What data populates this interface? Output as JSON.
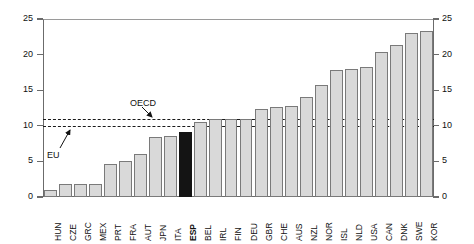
{
  "chart_data": {
    "type": "bar",
    "title": "",
    "subtitle": "",
    "xlabel": "",
    "ylabel": "",
    "ylim": [
      0,
      25
    ],
    "yticks": [
      0,
      5,
      10,
      15,
      20,
      25
    ],
    "ytick_labels": [
      "0",
      "5",
      "10",
      "15",
      "20",
      "25"
    ],
    "grid": false,
    "legend": "none",
    "dual_axis": true,
    "right_axis_ticks": [
      "0",
      "5",
      "10",
      "15",
      "20",
      "25"
    ],
    "categories": [
      "HUN",
      "CZE",
      "GRC",
      "MEX",
      "PRT",
      "FRA",
      "AUT",
      "JPN",
      "ITA",
      "ESP",
      "BEL",
      "IRL",
      "FIN",
      "DEU",
      "GBR",
      "CHE",
      "AUS",
      "NZL",
      "NOR",
      "ISL",
      "NLD",
      "USA",
      "CAN",
      "DNK",
      "SWE",
      "KOR"
    ],
    "values": [
      1.0,
      1.85,
      1.85,
      1.85,
      4.7,
      5.1,
      6.0,
      8.4,
      8.6,
      9.2,
      10.6,
      10.9,
      10.9,
      10.9,
      12.4,
      12.6,
      12.8,
      14.1,
      15.7,
      17.8,
      18.0,
      18.3,
      20.3,
      21.4,
      23.0,
      23.3
    ],
    "highlight_category": "ESP",
    "reference_lines": [
      {
        "label": "OECD",
        "value": 10.95
      },
      {
        "label": "EU",
        "value": 9.98
      }
    ],
    "annotations": [
      {
        "text": "OECD",
        "target": "OECD reference line"
      },
      {
        "text": "EU",
        "target": "EU reference line"
      }
    ]
  },
  "colors": {
    "bar_fill": "#d9d9d9",
    "bar_stroke": "#7a7a7a",
    "highlight_fill": "#141414",
    "refline": "#1a1a1a",
    "axis": "#6b6b6b",
    "text": "#111111",
    "background": "#ffffff"
  }
}
